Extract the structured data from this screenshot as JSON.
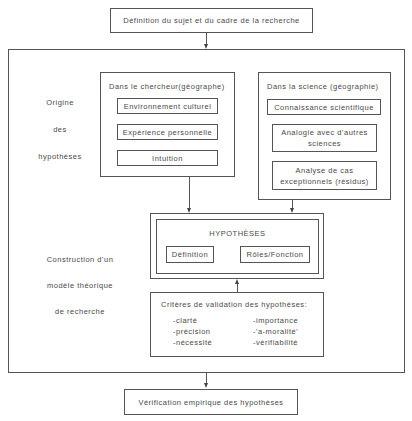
{
  "top_box": {
    "label": "Définition du sujet et du cadre de la recherche"
  },
  "origin_section": {
    "side_labels": [
      "Origine",
      "des",
      "hypothèses"
    ],
    "researcher_group": {
      "title": "Dans le chercheur(géographe)",
      "items": [
        "Environnement culturel",
        "Expérience personnelle",
        "Intuition"
      ]
    },
    "science_group": {
      "title": "Dans la science (géographie)",
      "items": [
        "Connaissance scientifique",
        "Analogie avec d'autres sciences",
        "Analyse de cas exceptionnels (résidus)"
      ]
    }
  },
  "construction_section": {
    "side_labels": [
      "Construction d'un",
      "modèle théorique",
      "de recherche"
    ],
    "hypotheses_box": {
      "title": "HYPOTHÈSES",
      "items": [
        "Définition",
        "Rôles/Fonction"
      ]
    },
    "criteria_box": {
      "title": "Critères de validation des hypothèses:",
      "left_items": [
        "-clarté",
        "-précision",
        "-nécessité"
      ],
      "right_items": [
        "-importance",
        "-'a-moralité'",
        "-vérifiabilité"
      ]
    }
  },
  "bottom_box": {
    "label": "Vérification empirique des hypothèses"
  }
}
